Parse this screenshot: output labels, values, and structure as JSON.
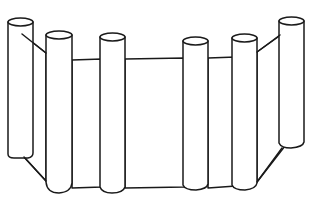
{
  "image": {
    "subject": "line drawing of a folding screen / fence made of six cylindrical pillars joined by flat panels",
    "stroke_color": "#1a1a1a",
    "background_color": "#ffffff",
    "pillar_count": 6,
    "panel_count": 5
  },
  "pillars": [
    {
      "name": "pillar-1",
      "x1": 8,
      "x2": 33,
      "top": 22,
      "bottom": 158
    },
    {
      "name": "pillar-2",
      "x1": 46,
      "x2": 72,
      "top": 35,
      "bottom": 193
    },
    {
      "name": "pillar-3",
      "x1": 100,
      "x2": 125,
      "top": 37,
      "bottom": 193
    },
    {
      "name": "pillar-4",
      "x1": 183,
      "x2": 208,
      "top": 41,
      "bottom": 189
    },
    {
      "name": "pillar-5",
      "x1": 232,
      "x2": 257,
      "top": 38,
      "bottom": 189
    },
    {
      "name": "pillar-6",
      "x1": 279,
      "x2": 304,
      "top": 21,
      "bottom": 147
    }
  ]
}
